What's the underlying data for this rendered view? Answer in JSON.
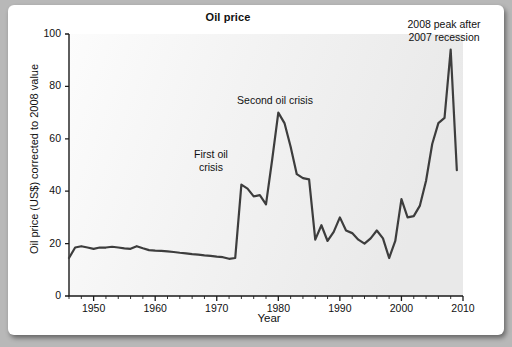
{
  "figure": {
    "background_color": "#b8b8b8",
    "card_color": "#ffffff"
  },
  "chart_data": {
    "type": "line",
    "title": "Oil price",
    "xlabel": "Year",
    "ylabel": "Oil price (US$) corrected to 2008 value",
    "xlim": [
      1946,
      2010
    ],
    "ylim": [
      0,
      100
    ],
    "grid": false,
    "legend": null,
    "line_color": "#3a3a3a",
    "plot_bg_color": "#f4f4f4",
    "x_major_ticks": [
      1950,
      1960,
      1970,
      1980,
      1990,
      2000,
      2010
    ],
    "x_major_tick_labels": [
      "1950",
      "1960",
      "1970",
      "1980",
      "1990",
      "2000",
      "2010"
    ],
    "x_minor_tick_step": 2,
    "y_ticks": [
      0,
      20,
      40,
      60,
      80,
      100
    ],
    "y_tick_labels": [
      "0",
      "20",
      "40",
      "60",
      "80",
      "100"
    ],
    "series": [
      {
        "name": "Oil price (US$, 2008 dollars)",
        "x": [
          1946,
          1947,
          1948,
          1949,
          1950,
          1951,
          1952,
          1953,
          1954,
          1955,
          1956,
          1957,
          1958,
          1959,
          1960,
          1961,
          1962,
          1963,
          1964,
          1965,
          1966,
          1967,
          1968,
          1969,
          1970,
          1971,
          1972,
          1973,
          1974,
          1975,
          1976,
          1977,
          1978,
          1979,
          1980,
          1981,
          1982,
          1983,
          1984,
          1985,
          1986,
          1987,
          1988,
          1989,
          1990,
          1991,
          1992,
          1993,
          1994,
          1995,
          1996,
          1997,
          1998,
          1999,
          2000,
          2001,
          2002,
          2003,
          2004,
          2005,
          2006,
          2007,
          2008,
          2009
        ],
        "values": [
          14.5,
          18.5,
          19.0,
          18.5,
          18.0,
          18.5,
          18.5,
          18.8,
          18.5,
          18.2,
          18.0,
          19.0,
          18.2,
          17.5,
          17.3,
          17.2,
          17.0,
          16.8,
          16.5,
          16.3,
          16.0,
          15.8,
          15.5,
          15.3,
          15.0,
          14.8,
          14.2,
          14.5,
          42.5,
          41.0,
          38.0,
          38.5,
          35.0,
          52.0,
          70.0,
          66.0,
          57.0,
          46.5,
          45.0,
          44.5,
          21.5,
          27.0,
          21.0,
          24.5,
          30.0,
          25.0,
          24.0,
          21.5,
          20.0,
          22.0,
          25.0,
          22.0,
          14.5,
          21.0,
          37.0,
          30.0,
          30.5,
          34.5,
          44.0,
          58.0,
          66.0,
          68.0,
          94.0,
          48.0
        ]
      }
    ],
    "annotations": [
      {
        "id": "first-oil-crisis",
        "text": "First oil\ncrisis",
        "x_year": 1974,
        "y_value": 52
      },
      {
        "id": "second-oil-crisis",
        "text": "Second oil crisis",
        "x_year": 1980,
        "y_value": 78
      },
      {
        "id": "peak-2008",
        "text": "2008 peak after\n2007 recession",
        "x_year": 2007,
        "y_value": 99
      }
    ]
  }
}
